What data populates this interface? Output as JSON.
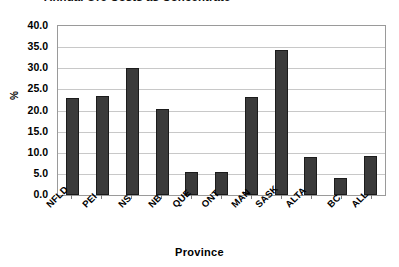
{
  "chart_data": {
    "type": "bar",
    "title": "Annual Ore Costs as Concentrate",
    "xlabel": "Province",
    "ylabel": "%",
    "categories": [
      "NFLD",
      "PEI",
      "NS",
      "NB",
      "QUE",
      "ONT",
      "MAN",
      "SASK",
      "ALTA",
      "BC",
      "ALL"
    ],
    "values": [
      23.0,
      23.4,
      30.0,
      20.4,
      5.4,
      5.4,
      23.3,
      34.4,
      8.9,
      4.0,
      9.2
    ],
    "ylim": [
      0.0,
      40.0
    ],
    "y_ticks": [
      "40.0",
      "35.0",
      "30.0",
      "25.0",
      "20.0",
      "15.0",
      "10.0",
      "5.0",
      "0.0"
    ],
    "y_tick_values": [
      40.0,
      35.0,
      30.0,
      25.0,
      20.0,
      15.0,
      10.0,
      5.0,
      0.0
    ],
    "grid": true,
    "legend": false,
    "bar_color": "#3b3b3b",
    "grid_color": "#c8c8c8",
    "axis_color": "#9a9a9a",
    "background": "#ffffff"
  }
}
